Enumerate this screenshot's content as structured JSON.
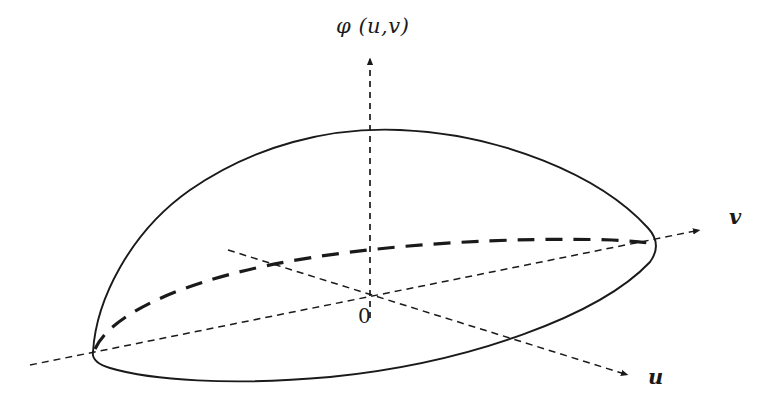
{
  "figure": {
    "type": "3d-surface-diagram",
    "background_color": "#ffffff",
    "stroke_color": "#1a1a1a"
  },
  "axes": {
    "vertical": {
      "label": "φ (u,v)",
      "name": "phi-axis",
      "style": "dashed",
      "arrow": "up"
    },
    "right": {
      "label": "v",
      "name": "v-axis",
      "style": "dashed",
      "arrow": "right"
    },
    "front": {
      "label": "u",
      "name": "u-axis",
      "style": "dashed",
      "arrow": "down-right"
    },
    "origin": {
      "label": "0",
      "name": "origin"
    }
  },
  "surface": {
    "outline_style": "solid",
    "hidden_edge_style": "dashed-thick"
  }
}
